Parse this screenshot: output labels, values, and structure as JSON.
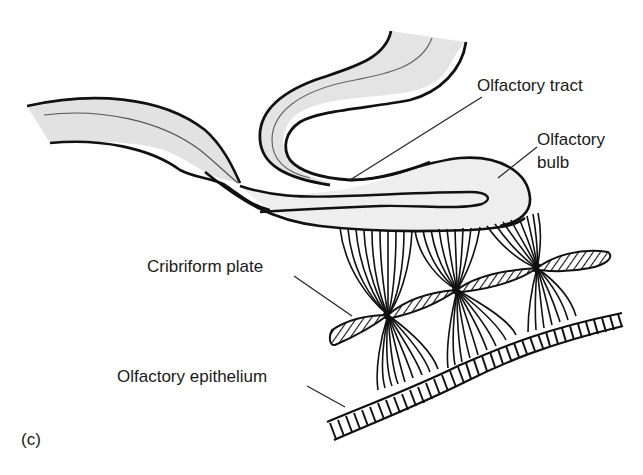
{
  "figure": {
    "panel_label": "(c)",
    "labels": {
      "olfactory_tract": "Olfactory tract",
      "olfactory_bulb_line1": "Olfactory",
      "olfactory_bulb_line2": "bulb",
      "cribriform_plate": "Cribriform plate",
      "olfactory_epithelium": "Olfactory epithelium"
    },
    "colors": {
      "outline": "#111111",
      "fill_light": "#ededed",
      "fill_dark": "#dcdcdc",
      "background": "#ffffff"
    }
  }
}
